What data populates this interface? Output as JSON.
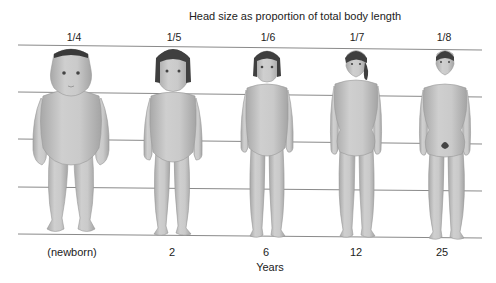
{
  "title": "Head size as proportion of total body length",
  "proportions": [
    {
      "label": "1/4",
      "x": 74
    },
    {
      "label": "1/5",
      "x": 174
    },
    {
      "label": "1/6",
      "x": 268
    },
    {
      "label": "1/7",
      "x": 357
    },
    {
      "label": "1/8",
      "x": 444
    }
  ],
  "ages": [
    {
      "label": "(newborn)",
      "x": 72
    },
    {
      "label": "2",
      "x": 172
    },
    {
      "label": "6",
      "x": 266
    },
    {
      "label": "12",
      "x": 356
    },
    {
      "label": "25",
      "x": 442
    }
  ],
  "xlabel": "Years",
  "figures": [
    {
      "age": "newborn",
      "head_fraction": "1/4"
    },
    {
      "age": "2",
      "head_fraction": "1/5"
    },
    {
      "age": "6",
      "head_fraction": "1/6"
    },
    {
      "age": "12",
      "head_fraction": "1/7"
    },
    {
      "age": "25",
      "head_fraction": "1/8"
    }
  ],
  "colors": {
    "skin": "#c4c4c4",
    "skin_shade": "#a9a9a9",
    "hair": "#4a4a4a",
    "grid_line": "#8a8a8a"
  }
}
